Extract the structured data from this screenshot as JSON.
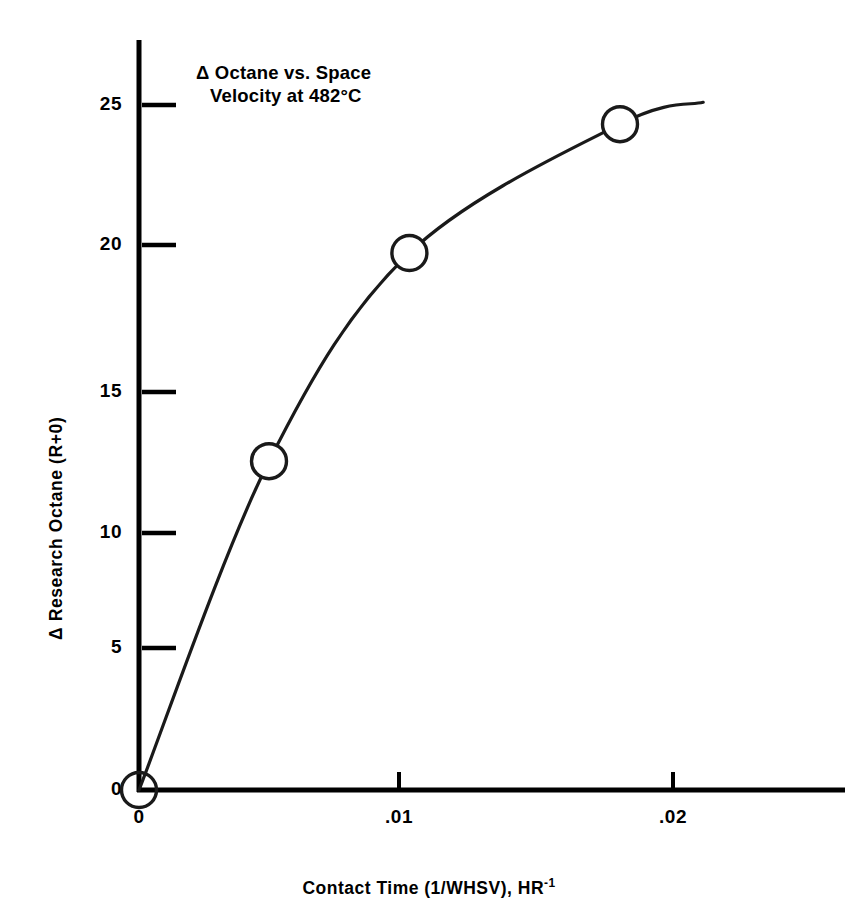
{
  "chart_data": {
    "type": "line",
    "title_line1": "Δ Octane vs. Space",
    "title_line2": "Velocity at 482°C",
    "xlabel": "Contact Time (1/WHSV), HR",
    "xlabel_sup": "-1",
    "ylabel": "Δ Research Octane (R+0)",
    "xlim": [
      0,
      0.0276
    ],
    "ylim": [
      0,
      26.5
    ],
    "xticks": [
      0,
      0.01,
      0.02
    ],
    "xticklabels": [
      "0",
      ".01",
      ".02"
    ],
    "yticks": [
      0,
      5,
      10,
      15,
      20,
      25
    ],
    "yticklabels": [
      "0",
      "5",
      "10",
      "15",
      "20",
      "25"
    ],
    "grid": false,
    "legend": "none",
    "marker": "open-circle",
    "line_color": "#1a1a1a",
    "axis_color": "#000000",
    "x": [
      0,
      0.005,
      0.0104,
      0.0185
    ],
    "y": [
      0,
      12.0,
      19.6,
      24.3
    ],
    "series": [
      {
        "name": "Δ Research Octane (R+0)",
        "points": [
          {
            "x": 0,
            "y": 0
          },
          {
            "x": 0.005,
            "y": 12.0
          },
          {
            "x": 0.0104,
            "y": 19.6
          },
          {
            "x": 0.0185,
            "y": 24.3
          }
        ]
      }
    ],
    "curve_end": {
      "x": 0.0217,
      "y": 25.1
    },
    "annotations": []
  }
}
